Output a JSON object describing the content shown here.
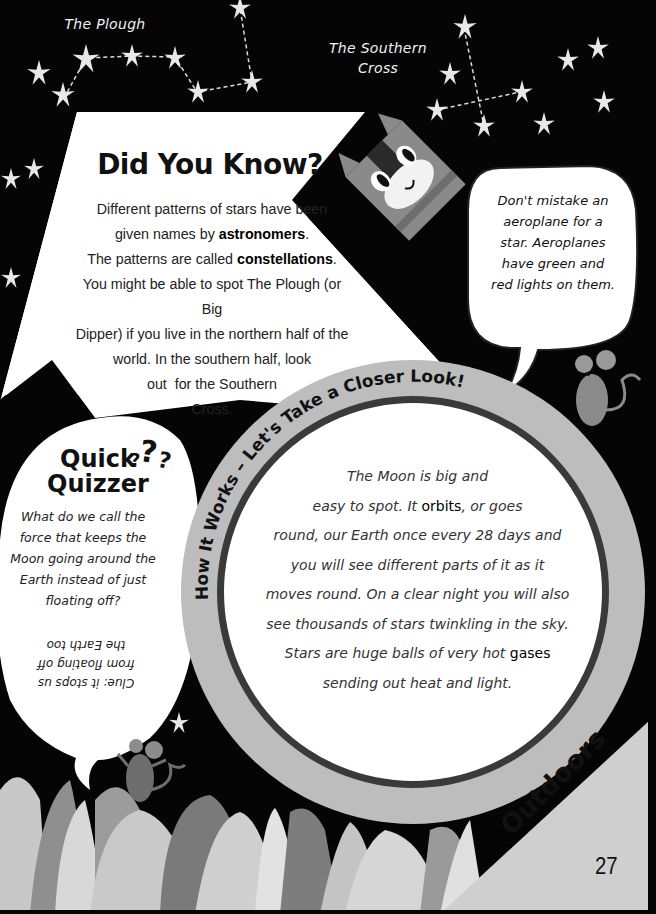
{
  "constellation_labels": {
    "plough": "The Plough",
    "southern_cross_line1": "The Southern",
    "southern_cross_line2": "Cross"
  },
  "did_you_know": {
    "title": "Did You Know?",
    "body": [
      {
        "text": "Different patterns of stars have been"
      },
      {
        "pre": "given names by ",
        "bold": "astronomers",
        "post": "."
      },
      {
        "pre": "The patterns are called ",
        "bold": "constellations",
        "post": "."
      },
      {
        "text": "You might be able to spot The Plough (or Big"
      },
      {
        "text": "Dipper) if you live in the northern half of the"
      },
      {
        "text": "world. In the southern half, look"
      },
      {
        "text": "out  for the Southern"
      },
      {
        "text": "Cross."
      }
    ]
  },
  "tip_bubble": {
    "lines": [
      "Don't mistake an",
      "aeroplane for a",
      "star. Aeroplanes",
      "have green and",
      "red lights on them."
    ]
  },
  "quick_quizzer": {
    "title_line1": "Quick",
    "title_line2": "Quizzer",
    "question_marks": "???",
    "question_lines": [
      "What do we call the",
      "force that keeps the",
      "Moon going around the",
      "Earth instead of just",
      "floating off?"
    ],
    "clue_lines": [
      "Clue: it stops us",
      "from floating off",
      "the Earth too"
    ]
  },
  "how_it_works": {
    "banner": "How It Works – Let's Take a Closer Look!",
    "body": [
      {
        "text": "The Moon is big and"
      },
      {
        "pre": "easy to spot. It ",
        "bold": "orbits",
        "post": ", or goes"
      },
      {
        "text": "round, our Earth once every 28 days and"
      },
      {
        "text": "you will see different parts of it as it"
      },
      {
        "text": "moves round. On a clear night you will also"
      },
      {
        "text": "see thousands of stars twinkling in the sky."
      },
      {
        "pre": "Stars are huge balls of very hot ",
        "bold": "gases",
        "post": ""
      },
      {
        "text": "sending out heat and light."
      }
    ]
  },
  "footer": {
    "section": "Outdoors",
    "page_number": "27"
  },
  "illustrations": [
    "cat-icon",
    "mouse-icon-right",
    "mouse-icon-left",
    "star-icon",
    "plant-leaves"
  ],
  "colors": {
    "sky": "#050505",
    "panel": "#ffffff",
    "ring": "#bdbdbd",
    "ring_stroke": "#3a3a3a",
    "leaf_light": "#c8c8c8",
    "leaf_mid": "#8f8f8f",
    "leaf_dark": "#6a6a6a"
  }
}
